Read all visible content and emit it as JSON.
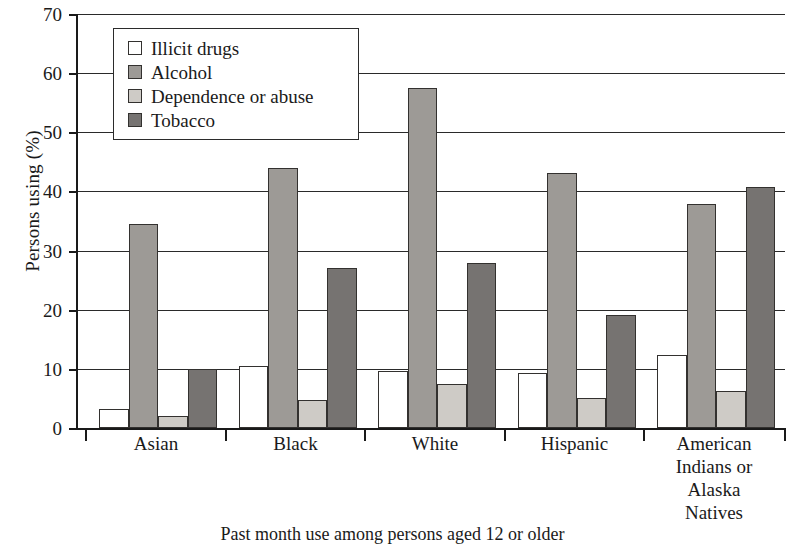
{
  "chart_data": {
    "type": "bar",
    "title": "",
    "xlabel": "Past month use among persons aged 12 or older",
    "ylabel": "Persons using (%)",
    "ylim": [
      0,
      70
    ],
    "yticks": [
      0,
      10,
      20,
      30,
      40,
      50,
      60,
      70
    ],
    "grid": true,
    "legend_position": "upper-left-inside",
    "categories": [
      "Asian",
      "Black",
      "White",
      "Hispanic",
      "American\nIndians or\nAlaska\nNatives"
    ],
    "category_labels_multiline": [
      [
        "Asian"
      ],
      [
        "Black"
      ],
      [
        "White"
      ],
      [
        "Hispanic"
      ],
      [
        "American",
        "Indians or",
        "Alaska",
        "Natives"
      ]
    ],
    "series": [
      {
        "name": "Illicit drugs",
        "color": "#ffffff",
        "values": [
          3.2,
          10.5,
          9.7,
          9.3,
          12.3
        ]
      },
      {
        "name": "Alcohol",
        "color": "#9d9a96",
        "values": [
          34.5,
          44.0,
          57.5,
          43.2,
          37.8
        ]
      },
      {
        "name": "Dependence or abuse",
        "color": "#cecbc6",
        "values": [
          2.0,
          4.8,
          7.5,
          5.0,
          6.2
        ]
      },
      {
        "name": "Tobacco",
        "color": "#767371",
        "values": [
          10.0,
          27.1,
          27.9,
          19.1,
          40.8
        ]
      }
    ]
  }
}
